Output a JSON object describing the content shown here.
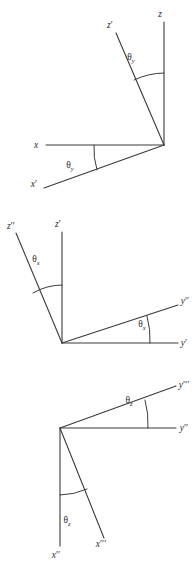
{
  "figure": {
    "background_color": "#ffffff",
    "line_color": "#3a3a3a",
    "text_color": "#2b2b2b",
    "caption": "",
    "panel_count": 3
  },
  "panels": [
    {
      "id": "panel-rotation-y",
      "angle_symbol": "θ",
      "angle_subscript": "y",
      "vertex": {
        "x": 164,
        "y": 145
      },
      "axes": [
        {
          "name": "z",
          "label": "z",
          "prime": "",
          "tip": {
            "x": 164,
            "y": 22
          },
          "label_pos": {
            "x": 160,
            "y": 17
          }
        },
        {
          "name": "z'",
          "label": "z",
          "prime": "′",
          "tip": {
            "x": 116,
            "y": 33
          },
          "label_pos": {
            "x": 110,
            "y": 28
          }
        },
        {
          "name": "x",
          "label": "x",
          "prime": "",
          "tip": {
            "x": 46,
            "y": 145
          },
          "label_pos": {
            "x": 36,
            "y": 148
          }
        },
        {
          "name": "x'",
          "label": "x",
          "prime": "′",
          "tip": {
            "x": 44,
            "y": 188
          },
          "label_pos": {
            "x": 34,
            "y": 187
          }
        }
      ],
      "angle_marks": [
        {
          "name": "angle-arc-z-zprime",
          "label_pos": {
            "x": 131,
            "y": 60
          }
        },
        {
          "name": "angle-arc-x-xprime",
          "label_pos": {
            "x": 70,
            "y": 168
          }
        }
      ]
    },
    {
      "id": "panel-rotation-x",
      "angle_symbol": "θ",
      "angle_subscript": "x",
      "vertex": {
        "x": 62,
        "y": 343
      },
      "axes": [
        {
          "name": "z'",
          "label": "z",
          "prime": "′",
          "tip": {
            "x": 62,
            "y": 232
          },
          "label_pos": {
            "x": 58,
            "y": 227
          }
        },
        {
          "name": "z''",
          "label": "z",
          "prime": "′′",
          "tip": {
            "x": 16,
            "y": 233
          },
          "label_pos": {
            "x": 9,
            "y": 229
          }
        },
        {
          "name": "y'",
          "label": "y",
          "prime": "′",
          "tip": {
            "x": 178,
            "y": 343
          },
          "label_pos": {
            "x": 180,
            "y": 341
          }
        },
        {
          "name": "y''",
          "label": "y",
          "prime": "′′",
          "tip": {
            "x": 178,
            "y": 305
          },
          "label_pos": {
            "x": 180,
            "y": 303
          }
        }
      ],
      "angle_marks": [
        {
          "name": "angle-arc-zprime-zdoubleprime",
          "label_pos": {
            "x": 36,
            "y": 262
          }
        },
        {
          "name": "angle-arc-yprime-ydoubleprime",
          "label_pos": {
            "x": 142,
            "y": 327
          }
        }
      ]
    },
    {
      "id": "panel-rotation-z",
      "angle_symbol": "θ",
      "angle_subscript": "z",
      "vertex": {
        "x": 60,
        "y": 428
      },
      "axes": [
        {
          "name": "y''",
          "label": "y",
          "prime": "′′",
          "tip": {
            "x": 176,
            "y": 428
          },
          "label_pos": {
            "x": 178,
            "y": 426
          }
        },
        {
          "name": "y'''",
          "label": "y",
          "prime": "′′′",
          "tip": {
            "x": 176,
            "y": 386
          },
          "label_pos": {
            "x": 178,
            "y": 385
          }
        },
        {
          "name": "x''",
          "label": "x",
          "prime": "′′",
          "tip": {
            "x": 60,
            "y": 546
          },
          "label_pos": {
            "x": 53,
            "y": 556
          }
        },
        {
          "name": "x'''",
          "label": "x",
          "prime": "′′′",
          "tip": {
            "x": 104,
            "y": 538
          },
          "label_pos": {
            "x": 97,
            "y": 545
          }
        }
      ],
      "angle_marks": [
        {
          "name": "angle-arc-ydoubleprime-ytripleprime",
          "label_pos": {
            "x": 129,
            "y": 403
          }
        },
        {
          "name": "angle-arc-xdoubleprime-xtripleprime",
          "label_pos": {
            "x": 67,
            "y": 523
          }
        }
      ]
    }
  ]
}
